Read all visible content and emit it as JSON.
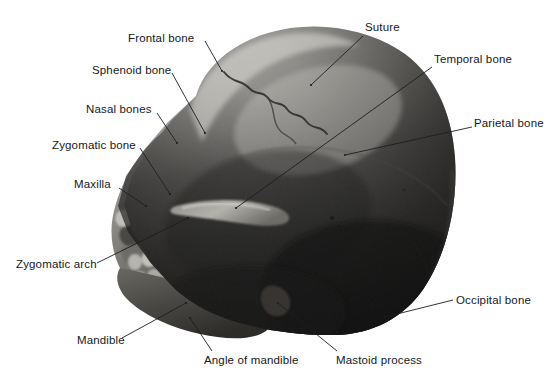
{
  "figure": {
    "media_type": "black-and-white anatomical photograph",
    "width": 554,
    "height": 390,
    "background_color": "#ffffff",
    "text_color": "#15181a",
    "leader_line_color": "#1b1e20"
  },
  "labels": [
    {
      "id": "frontal-bone",
      "text": "Frontal bone",
      "x": 128,
      "y": 32,
      "align": "left"
    },
    {
      "id": "suture",
      "text": "Suture",
      "x": 365,
      "y": 21,
      "align": "left"
    },
    {
      "id": "temporal-bone",
      "text": "Temporal bone",
      "x": 434,
      "y": 53,
      "align": "left"
    },
    {
      "id": "sphenoid-bone",
      "text": "Sphenoid bone",
      "x": 92,
      "y": 64,
      "align": "left"
    },
    {
      "id": "nasal-bones",
      "text": "Nasal bones",
      "x": 86,
      "y": 103,
      "align": "left"
    },
    {
      "id": "parietal-bone",
      "text": "Parietal bone",
      "x": 474,
      "y": 117,
      "align": "left"
    },
    {
      "id": "zygomatic-bone",
      "text": "Zygomatic bone",
      "x": 52,
      "y": 139,
      "align": "left"
    },
    {
      "id": "maxilla",
      "text": "Maxilla",
      "x": 74,
      "y": 178,
      "align": "left"
    },
    {
      "id": "zygomatic-arch",
      "text": "Zygomatic arch",
      "x": 16,
      "y": 258,
      "align": "left"
    },
    {
      "id": "occipital-bone",
      "text": "Occipital bone",
      "x": 456,
      "y": 294,
      "align": "left"
    },
    {
      "id": "mandible",
      "text": "Mandible",
      "x": 77,
      "y": 334,
      "align": "left"
    },
    {
      "id": "angle-of-mandible",
      "text": "Angle of mandible",
      "x": 204,
      "y": 354,
      "align": "left"
    },
    {
      "id": "mastoid-process",
      "text": "Mastoid process",
      "x": 336,
      "y": 354,
      "align": "left"
    }
  ],
  "leader_lines": [
    {
      "id": "leader-frontal-bone",
      "x1": 205,
      "y1": 41,
      "x2": 222,
      "y2": 71
    },
    {
      "id": "leader-suture",
      "x1": 363,
      "y1": 36,
      "x2": 311,
      "y2": 85
    },
    {
      "id": "leader-temporal-bone",
      "x1": 432,
      "y1": 67,
      "x2": 236,
      "y2": 208
    },
    {
      "id": "leader-sphenoid-bone",
      "x1": 172,
      "y1": 73,
      "x2": 205,
      "y2": 133
    },
    {
      "id": "leader-nasal-bones",
      "x1": 157,
      "y1": 113,
      "x2": 177,
      "y2": 143
    },
    {
      "id": "leader-parietal-bone",
      "x1": 472,
      "y1": 127,
      "x2": 345,
      "y2": 155
    },
    {
      "id": "leader-zygomatic-bone",
      "x1": 140,
      "y1": 148,
      "x2": 170,
      "y2": 194
    },
    {
      "id": "leader-maxilla",
      "x1": 119,
      "y1": 188,
      "x2": 146,
      "y2": 206
    },
    {
      "id": "leader-zygomatic-arch",
      "x1": 97,
      "y1": 263,
      "x2": 188,
      "y2": 218
    },
    {
      "id": "leader-occipital-bone",
      "x1": 453,
      "y1": 300,
      "x2": 385,
      "y2": 317
    },
    {
      "id": "leader-mandible",
      "x1": 122,
      "y1": 338,
      "x2": 186,
      "y2": 303
    },
    {
      "id": "leader-angle-of-mandible",
      "x1": 212,
      "y1": 351,
      "x2": 190,
      "y2": 318
    },
    {
      "id": "leader-mastoid-process",
      "x1": 337,
      "y1": 351,
      "x2": 278,
      "y2": 303
    }
  ]
}
